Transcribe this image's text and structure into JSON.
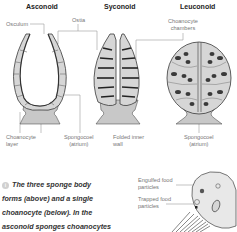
{
  "diagram": {
    "body_forms": [
      {
        "title": "Asconoid"
      },
      {
        "title": "Syconoid"
      },
      {
        "title": "Leuconoid"
      }
    ],
    "labels": {
      "osculum": "Osculum",
      "ostia": "Ostia",
      "choanocyte_chambers_1": "Choanocyte",
      "choanocyte_chambers_2": "chambers",
      "choanocyte_layer_1": "Choanocyte",
      "choanocyte_layer_2": "layer",
      "spongocoel_1": "Spongocoel",
      "spongocoel_1b": "(atrium)",
      "folded_wall_1": "Folded inner",
      "folded_wall_2": "wall",
      "spongocoel_2": "Spongocoel",
      "spongocoel_2b": "(atrium)",
      "engulfed_1": "Engulfed food",
      "engulfed_2": "particles",
      "trapped_1": "Trapped food",
      "trapped_2": "particles"
    },
    "caption": {
      "icon": "info-icon",
      "lines": [
        "The three sponge body",
        "forms (above) and a single",
        "choanocyte (below). In the",
        "asconoid sponges choanocytes"
      ]
    },
    "colors": {
      "cell_fill": "#d6d6d6",
      "outline": "#3a3a3a",
      "base_fill": "#c8c8c8",
      "leader_line": "#9a9a9a"
    }
  }
}
